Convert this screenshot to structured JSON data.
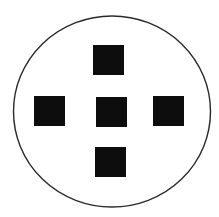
{
  "canvas": {
    "width": 219,
    "height": 217,
    "background": "#ffffff"
  },
  "outline": {
    "shape": "circle",
    "cx": 112,
    "cy": 111.5,
    "rx": 98.5,
    "ry": 95.5,
    "stroke": "#2a2a2a",
    "stroke_width": 1.4,
    "fill": "#ffffff"
  },
  "squares": [
    {
      "id": "top",
      "x": 93,
      "y": 45,
      "w": 31,
      "h": 30,
      "fill": "#0d0d0d"
    },
    {
      "id": "left",
      "x": 34,
      "y": 96,
      "w": 31,
      "h": 30,
      "fill": "#0d0d0d"
    },
    {
      "id": "center",
      "x": 96,
      "y": 97,
      "w": 31,
      "h": 30,
      "fill": "#0d0d0d"
    },
    {
      "id": "right",
      "x": 153,
      "y": 96,
      "w": 31,
      "h": 30,
      "fill": "#0d0d0d"
    },
    {
      "id": "bottom",
      "x": 95,
      "y": 147,
      "w": 31,
      "h": 30,
      "fill": "#0d0d0d"
    }
  ]
}
